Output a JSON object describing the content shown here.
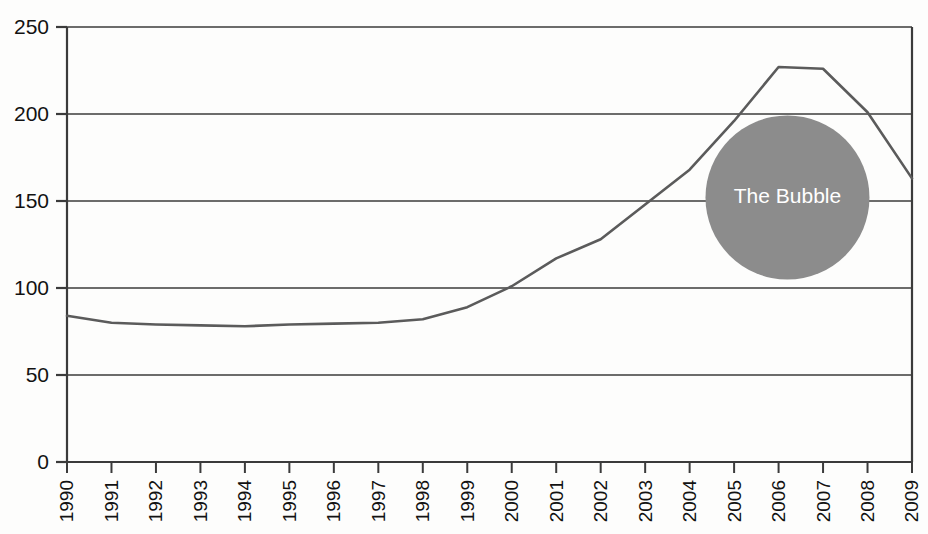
{
  "chart_data": {
    "type": "line",
    "title": "",
    "subtitle": "",
    "xlabel": "",
    "ylabel": "",
    "annotations": [
      {
        "text": "The Bubble",
        "shape": "circle",
        "fill": "#8c8c8c",
        "text_color": "#ffffff",
        "center_x": 2006.2,
        "center_y": 152,
        "radius_px": 82
      }
    ],
    "grid": true,
    "grid_color": "#3b3b3b",
    "legend": null,
    "axis_color": "#3b3b3b",
    "line_color": "#5b5b5b",
    "xlim": [
      1990,
      2009
    ],
    "ylim": [
      0,
      250
    ],
    "yticks": [
      0,
      50,
      100,
      150,
      200,
      250
    ],
    "ytick_labels": [
      "0",
      "50",
      "100",
      "150",
      "200",
      "250"
    ],
    "categories": [
      "1990",
      "1991",
      "1992",
      "1993",
      "1994",
      "1995",
      "1996",
      "1997",
      "1998",
      "1999",
      "2000",
      "2001",
      "2002",
      "2003",
      "2004",
      "2005",
      "2006",
      "2007",
      "2008",
      "2009"
    ],
    "x": [
      1990,
      1991,
      1992,
      1993,
      1994,
      1995,
      1996,
      1997,
      1998,
      1999,
      2000,
      2001,
      2002,
      2003,
      2004,
      2005,
      2006,
      2007,
      2008,
      2009
    ],
    "values": [
      84,
      80,
      79,
      78.5,
      78,
      79,
      79.5,
      80,
      82,
      89,
      101,
      117,
      128,
      148,
      168,
      196,
      227,
      226,
      201,
      163
    ],
    "series": [
      {
        "name": "index",
        "values": [
          84,
          80,
          79,
          78.5,
          78,
          79,
          79.5,
          80,
          82,
          89,
          101,
          117,
          128,
          148,
          168,
          196,
          227,
          226,
          201,
          163
        ]
      }
    ]
  }
}
